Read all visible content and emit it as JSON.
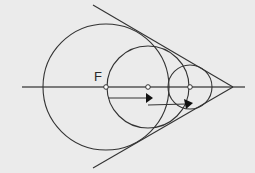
{
  "diagram": {
    "background": "#ebebeb",
    "stroke_color": "#333333",
    "label_F": "F",
    "axis": {
      "x1": 22,
      "y": 87,
      "x2": 245
    },
    "vertex": {
      "x": 233,
      "y": 87
    },
    "tangent_lines": [
      {
        "name": "upper-tangent",
        "x1": 93,
        "y1": 5,
        "x2": 233,
        "y2": 87
      },
      {
        "name": "lower-tangent",
        "x1": 93,
        "y1": 168,
        "x2": 233,
        "y2": 87
      }
    ],
    "circles": [
      {
        "name": "large-circle",
        "cx": 106,
        "cy": 87,
        "r": 63
      },
      {
        "name": "medium-circle",
        "cx": 148,
        "cy": 87,
        "r": 41
      },
      {
        "name": "small-circle",
        "cx": 190,
        "cy": 87,
        "r": 22
      }
    ],
    "center_points": [
      {
        "name": "focus-point-F",
        "cx": 106,
        "cy": 87
      },
      {
        "name": "medium-center-point",
        "cx": 148,
        "cy": 87
      },
      {
        "name": "small-center-point",
        "cx": 190,
        "cy": 87
      }
    ],
    "arrows": [
      {
        "name": "arrow-1",
        "x1": 108,
        "y1": 98,
        "x2": 146,
        "y2": 98
      },
      {
        "name": "arrow-2",
        "x1": 148,
        "y1": 105,
        "x2": 186,
        "y2": 104
      }
    ]
  }
}
